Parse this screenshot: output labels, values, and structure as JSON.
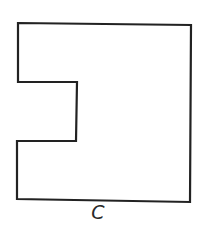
{
  "figure": {
    "label": "C",
    "stroke_color": "#222222",
    "fill_color": "#ffffff",
    "shape": {
      "description": "square with a rectangular notch cut into the left side",
      "points": [
        [
          18,
          23
        ],
        [
          191,
          25
        ],
        [
          190,
          202
        ],
        [
          17,
          199
        ],
        [
          17,
          141
        ],
        [
          76,
          141
        ],
        [
          77,
          82
        ],
        [
          18,
          82
        ]
      ]
    }
  }
}
